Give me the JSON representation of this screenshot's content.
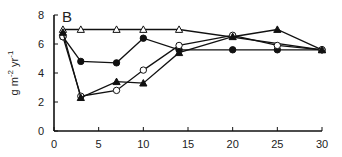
{
  "chart_data": {
    "type": "line",
    "title": "",
    "panel_label": "B",
    "xlabel": "",
    "ylabel": "g m-2 yr-1",
    "ylabel_parts": {
      "base": "g m",
      "sup1": "-2",
      "mid": " yr",
      "sup2": "-1"
    },
    "xlim": [
      0,
      30
    ],
    "ylim": [
      0,
      8
    ],
    "xticks": [
      0,
      5,
      10,
      15,
      20,
      25,
      30
    ],
    "yticks": [
      0,
      2,
      4,
      6,
      8
    ],
    "grid": false,
    "legend": "none",
    "series": [
      {
        "name": "open-triangle",
        "marker": "triangle-open",
        "x": [
          1,
          3,
          7,
          10,
          14,
          30
        ],
        "y": [
          7.0,
          7.0,
          7.0,
          7.0,
          7.0,
          5.6
        ]
      },
      {
        "name": "filled-circle",
        "marker": "circle-filled",
        "x": [
          1,
          3,
          7,
          10,
          14,
          20,
          25,
          30
        ],
        "y": [
          6.5,
          4.8,
          4.7,
          6.4,
          5.6,
          5.6,
          5.6,
          5.6
        ]
      },
      {
        "name": "open-circle",
        "marker": "circle-open",
        "x": [
          1,
          3,
          7,
          10,
          14,
          20,
          25,
          30
        ],
        "y": [
          6.5,
          2.4,
          2.8,
          4.2,
          5.9,
          6.6,
          5.9,
          5.6
        ]
      },
      {
        "name": "filled-triangle",
        "marker": "triangle-filled",
        "x": [
          1,
          3,
          7,
          10,
          14,
          20,
          25,
          30
        ],
        "y": [
          6.8,
          2.3,
          3.4,
          3.3,
          5.4,
          6.5,
          7.0,
          5.6
        ]
      }
    ]
  }
}
